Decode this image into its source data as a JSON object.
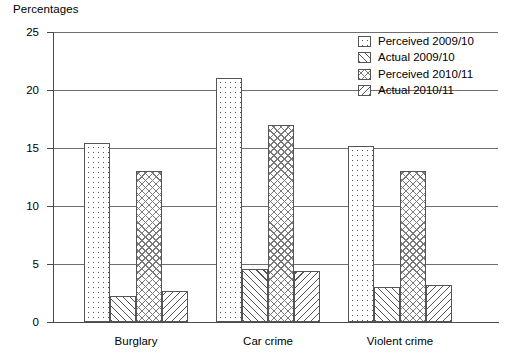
{
  "chart_data": {
    "type": "bar",
    "title": "",
    "ylabel": "Percentages",
    "xlabel": "",
    "ylim": [
      0,
      25
    ],
    "yticks": [
      0,
      5,
      10,
      15,
      20,
      25
    ],
    "grid": true,
    "legend_position": "top-right",
    "categories": [
      "Burglary",
      "Car crime",
      "Violent crime"
    ],
    "series": [
      {
        "name": "Perceived 2009/10",
        "pattern": "dots",
        "values": [
          15.4,
          21.0,
          15.2
        ]
      },
      {
        "name": "Actual 2009/10",
        "pattern": "backslash-hatch",
        "values": [
          2.2,
          4.6,
          3.0
        ]
      },
      {
        "name": "Perceived 2010/11",
        "pattern": "cross-hatch",
        "values": [
          13.0,
          17.0,
          13.0
        ]
      },
      {
        "name": "Actual 2010/11",
        "pattern": "forwardslash-hatch",
        "values": [
          2.7,
          4.4,
          3.2
        ]
      }
    ]
  },
  "axis": {
    "y_title": "Percentages",
    "y_tick_labels": [
      "0",
      "5",
      "10",
      "15",
      "20",
      "25"
    ],
    "x_tick_labels": [
      "Burglary",
      "Car crime",
      "Violent crime"
    ]
  },
  "legend": {
    "items": [
      {
        "label": "Perceived 2009/10"
      },
      {
        "label": "Actual 2009/10"
      },
      {
        "label": "Perceived 2010/11"
      },
      {
        "label": "Actual 2010/11"
      }
    ]
  },
  "colors": {
    "ink": "#555555",
    "grid": "#6e6e6e",
    "axis": "#4a4a4a",
    "background": "#ffffff"
  }
}
